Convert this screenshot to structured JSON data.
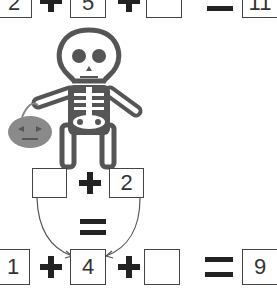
{
  "equations": {
    "top": {
      "a": "2",
      "b": "5",
      "c": "",
      "result": "11"
    },
    "middle": {
      "a": "",
      "b": "2"
    },
    "bottom": {
      "a": "1",
      "b": "4",
      "c": "",
      "result": "9"
    }
  },
  "illustration": {
    "subject": "skeleton-holding-pumpkin-bucket"
  },
  "colors": {
    "stroke": "#444444",
    "pumpkin": "#8a8a8a",
    "skull_fill": "#ffffff"
  }
}
